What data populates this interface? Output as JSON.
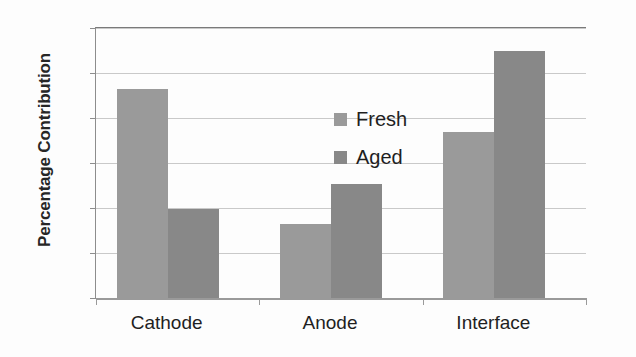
{
  "chart_data": {
    "type": "bar",
    "title": "",
    "subtitle": "",
    "xlabel": "",
    "ylabel": "Percentage Contribution",
    "categories": [
      "Cathode",
      "Anode",
      "Interface"
    ],
    "series": [
      {
        "name": "Fresh",
        "color": "#9a9a9a",
        "values": [
          46.5,
          16.4,
          37.0
        ]
      },
      {
        "name": "Aged",
        "color": "#888888",
        "values": [
          19.8,
          25.3,
          55.0
        ]
      }
    ],
    "ylim": [
      0,
      60
    ],
    "yticks": [
      0,
      10,
      20,
      30,
      40,
      50,
      60
    ],
    "ytick_labels": [
      "0",
      "10",
      "20",
      "30",
      "40",
      "50",
      "60"
    ],
    "grid": "horizontal",
    "legend_position": "upper-center-inside",
    "legend_entries": [
      "Fresh",
      "Aged"
    ],
    "annotations": []
  }
}
